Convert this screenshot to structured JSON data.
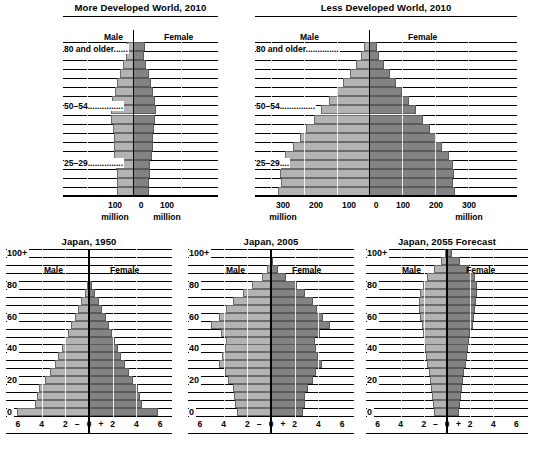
{
  "colors": {
    "male_fill": "#b3b3b3",
    "female_fill": "#838383",
    "line": "#000000",
    "background": "#ffffff"
  },
  "legend": {
    "male": "Male",
    "female": "Female"
  },
  "charts": [
    {
      "id": "more-developed-world-2010",
      "title": "More Developed World, 2010",
      "age_labels": [
        "80 and older......",
        "50–54...............",
        "25–29..............."
      ],
      "xticks_left": [
        "100"
      ],
      "xticks_center": "0",
      "xticks_right": [
        "100"
      ],
      "unit_left": "million",
      "unit_right": "million",
      "axis_max": 150
    },
    {
      "id": "less-developed-world-2010",
      "title": "Less Developed World, 2010",
      "age_labels": [
        "80 and older..............",
        "50–54...............",
        "25–29...."
      ],
      "xticks_left": [
        "300",
        "200",
        "100"
      ],
      "xticks_center": "0",
      "xticks_right": [
        "100",
        "200",
        "300"
      ],
      "unit_left": "million",
      "unit_right": "million",
      "axis_max": 350
    },
    {
      "id": "japan-1950",
      "title": "Japan, 1950",
      "ylabels": [
        "100+",
        "80",
        "60",
        "40",
        "20",
        "0"
      ],
      "xticks": [
        "6",
        "4",
        "2",
        "–",
        "0",
        "+",
        "2",
        "4",
        "6"
      ],
      "axis_max": 7
    },
    {
      "id": "japan-2005",
      "title": "Japan, 2005",
      "ylabels": [
        "100+",
        "80",
        "60",
        "40",
        "20",
        "0"
      ],
      "xticks": [
        "6",
        "4",
        "2",
        "–",
        "0",
        "+",
        "2",
        "4",
        "6"
      ],
      "axis_max": 7
    },
    {
      "id": "japan-2055-forecast",
      "title": "Japan, 2055 Forecast",
      "ylabels": [
        "100+",
        "80",
        "60",
        "40",
        "20",
        "0"
      ],
      "xticks": [
        "6",
        "4",
        "2",
        "–",
        "0",
        "+",
        "2",
        "4",
        "6"
      ],
      "axis_max": 7
    }
  ],
  "chart_data": [
    {
      "type": "bar",
      "id": "more-developed-world-2010",
      "title": "More Developed World, 2010",
      "orientation": "population-pyramid",
      "xlabel": "million",
      "ylabel": "age group",
      "xlim": [
        -150,
        150
      ],
      "grid": true,
      "legend": [
        "Male",
        "Female"
      ],
      "categories": [
        "0–4",
        "5–9",
        "10–14",
        "15–19",
        "20–24",
        "25–29",
        "30–34",
        "35–39",
        "40–44",
        "45–49",
        "50–54",
        "55–59",
        "60–64",
        "65–69",
        "70–74",
        "75–79",
        "80 and older"
      ],
      "series": [
        {
          "name": "Male",
          "values": [
            35,
            35,
            36,
            38,
            41,
            42,
            42,
            44,
            47,
            47,
            45,
            40,
            36,
            29,
            23,
            17,
            14
          ]
        },
        {
          "name": "Female",
          "values": [
            33,
            33,
            34,
            36,
            39,
            41,
            41,
            43,
            46,
            47,
            46,
            42,
            38,
            32,
            27,
            23,
            25
          ]
        }
      ]
    },
    {
      "type": "bar",
      "id": "less-developed-world-2010",
      "title": "Less Developed World, 2010",
      "orientation": "population-pyramid",
      "xlabel": "million",
      "ylabel": "age group",
      "xlim": [
        -350,
        350
      ],
      "grid": true,
      "legend": [
        "Male",
        "Female"
      ],
      "categories": [
        "0–4",
        "5–9",
        "10–14",
        "15–19",
        "20–24",
        "25–29",
        "30–34",
        "35–39",
        "40–44",
        "45–49",
        "50–54",
        "55–59",
        "60–64",
        "65–69",
        "70–74",
        "75–79",
        "80 and older"
      ],
      "series": [
        {
          "name": "Male",
          "values": [
            280,
            272,
            275,
            272,
            258,
            235,
            213,
            193,
            170,
            147,
            124,
            101,
            80,
            60,
            42,
            26,
            17
          ]
        },
        {
          "name": "Female",
          "values": [
            262,
            255,
            257,
            254,
            243,
            222,
            202,
            184,
            163,
            142,
            120,
            99,
            80,
            62,
            45,
            30,
            24
          ]
        }
      ]
    },
    {
      "type": "bar",
      "id": "japan-1950",
      "title": "Japan, 1950",
      "orientation": "population-pyramid",
      "xlabel": "millions",
      "ylabel": "age",
      "xlim": [
        -7,
        7
      ],
      "grid": true,
      "legend": [
        "Male",
        "Female"
      ],
      "categories": [
        "0–4",
        "5–9",
        "10–14",
        "15–19",
        "20–24",
        "25–29",
        "30–34",
        "35–39",
        "40–44",
        "45–49",
        "50–54",
        "55–59",
        "60–64",
        "65–69",
        "70–74",
        "75–79",
        "80–84",
        "85–89",
        "90–94",
        "95–99",
        "100+"
      ],
      "series": [
        {
          "name": "Male",
          "values": [
            6.1,
            4.6,
            4.4,
            4.2,
            3.7,
            3.3,
            2.9,
            2.6,
            2.3,
            2.0,
            1.8,
            1.5,
            1.2,
            0.95,
            0.65,
            0.38,
            0.18,
            0.07,
            0.02,
            0.005,
            0.001
          ]
        },
        {
          "name": "Female",
          "values": [
            5.8,
            4.5,
            4.3,
            4.1,
            3.7,
            3.4,
            3.0,
            2.7,
            2.4,
            2.2,
            1.9,
            1.7,
            1.4,
            1.1,
            0.8,
            0.5,
            0.25,
            0.1,
            0.03,
            0.006,
            0.001
          ]
        }
      ]
    },
    {
      "type": "bar",
      "id": "japan-2005",
      "title": "Japan, 2005",
      "orientation": "population-pyramid",
      "xlabel": "millions",
      "ylabel": "age",
      "xlim": [
        -7,
        7
      ],
      "grid": true,
      "legend": [
        "Male",
        "Female"
      ],
      "categories": [
        "0–4",
        "5–9",
        "10–14",
        "15–19",
        "20–24",
        "25–29",
        "30–34",
        "35–39",
        "40–44",
        "45–49",
        "50–54",
        "55–59",
        "60–64",
        "65–69",
        "70–74",
        "75–79",
        "80–84",
        "85–89",
        "90–94",
        "95–99",
        "100+"
      ],
      "series": [
        {
          "name": "Male",
          "values": [
            2.9,
            3.0,
            3.1,
            3.2,
            3.6,
            3.9,
            4.4,
            4.1,
            3.9,
            3.8,
            4.2,
            5.1,
            4.4,
            3.8,
            3.2,
            2.4,
            1.6,
            0.8,
            0.3,
            0.07,
            0.01
          ]
        },
        {
          "name": "Female",
          "values": [
            2.7,
            2.9,
            2.9,
            3.1,
            3.5,
            3.8,
            4.3,
            4.0,
            3.8,
            3.7,
            4.1,
            5.0,
            4.4,
            3.9,
            3.5,
            2.9,
            2.2,
            1.3,
            0.6,
            0.17,
            0.03
          ]
        }
      ]
    },
    {
      "type": "bar",
      "id": "japan-2055-forecast",
      "title": "Japan, 2055 Forecast",
      "orientation": "population-pyramid",
      "xlabel": "millions",
      "ylabel": "age",
      "xlim": [
        -7,
        7
      ],
      "grid": true,
      "legend": [
        "Male",
        "Female"
      ],
      "categories": [
        "0–4",
        "5–9",
        "10–14",
        "15–19",
        "20–24",
        "25–29",
        "30–34",
        "35–39",
        "40–44",
        "45–49",
        "50–54",
        "55–59",
        "60–64",
        "65–69",
        "70–74",
        "75–79",
        "80–84",
        "85–89",
        "90–94",
        "95–99",
        "100+"
      ],
      "series": [
        {
          "name": "Male",
          "values": [
            1.1,
            1.2,
            1.3,
            1.4,
            1.5,
            1.6,
            1.7,
            1.8,
            1.9,
            2.0,
            2.1,
            2.2,
            2.3,
            2.4,
            2.4,
            2.3,
            2.1,
            1.7,
            1.1,
            0.5,
            0.15
          ]
        },
        {
          "name": "Female",
          "values": [
            1.0,
            1.1,
            1.2,
            1.3,
            1.4,
            1.5,
            1.6,
            1.7,
            1.8,
            1.9,
            2.0,
            2.2,
            2.3,
            2.4,
            2.5,
            2.6,
            2.6,
            2.4,
            1.9,
            1.1,
            0.45
          ]
        }
      ]
    }
  ]
}
